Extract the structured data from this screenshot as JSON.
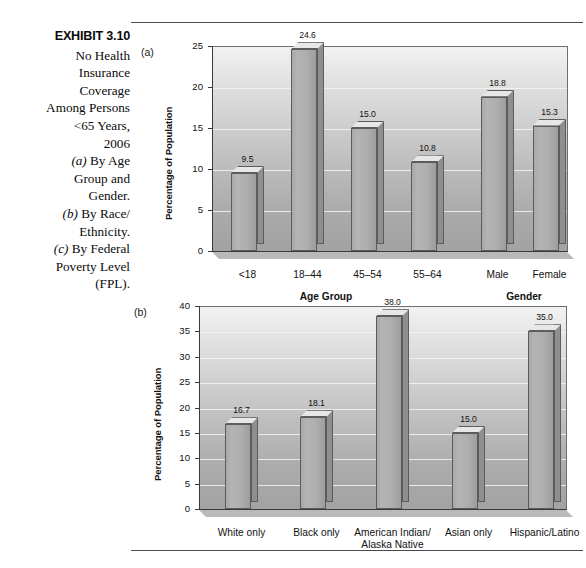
{
  "caption": {
    "exhibit_label": "EXHIBIT 3.10",
    "lines": [
      "No Health",
      "Insurance",
      "Coverage",
      "Among Persons",
      "<65 Years,",
      "2006"
    ],
    "notes": [
      {
        "tag": "(a)",
        "text": " By Age"
      },
      {
        "tag": "",
        "text": "Group and"
      },
      {
        "tag": "",
        "text": "Gender."
      },
      {
        "tag": "(b)",
        "text": " By Race/"
      },
      {
        "tag": "",
        "text": "Ethnicity."
      },
      {
        "tag": "(c)",
        "text": " By Federal"
      },
      {
        "tag": "",
        "text": "Poverty Level"
      },
      {
        "tag": "",
        "text": "(FPL)."
      }
    ]
  },
  "panel_a": {
    "tag": "(a)",
    "ylabel": "Percentage of Population",
    "yticks": [
      "25",
      "20",
      "15",
      "10",
      "5",
      "0"
    ],
    "group_labels": [
      "Age Group",
      "Gender"
    ]
  },
  "panel_b": {
    "tag": "(b)",
    "ylabel": "Percentage of Population",
    "yticks": [
      "40",
      "35",
      "30",
      "25",
      "20",
      "15",
      "10",
      "5",
      "0"
    ]
  },
  "chart_data": [
    {
      "type": "bar",
      "id": "a",
      "title": "No Health Insurance Coverage Among Persons <65 Years, 2006 — By Age Group and Gender",
      "xlabel": "Age Group / Gender",
      "ylabel": "Percentage of Population",
      "ylim": [
        0,
        25
      ],
      "ytick_step": 5,
      "grid": true,
      "legend": "none",
      "categories": [
        "<18",
        "18–44",
        "45–54",
        "55–64",
        "Male",
        "Female"
      ],
      "values": [
        9.5,
        24.6,
        15.0,
        10.8,
        18.8,
        15.3
      ],
      "value_labels": [
        "9.5",
        "24.6",
        "15.0",
        "10.8",
        "18.8",
        "15.3"
      ],
      "groups": [
        {
          "name": "Age Group",
          "categories": [
            "<18",
            "18–44",
            "45–54",
            "55–64"
          ]
        },
        {
          "name": "Gender",
          "categories": [
            "Male",
            "Female"
          ]
        }
      ]
    },
    {
      "type": "bar",
      "id": "b",
      "title": "No Health Insurance Coverage Among Persons <65 Years, 2006 — By Race/Ethnicity",
      "xlabel": "Race/Ethnicity",
      "ylabel": "Percentage of Population",
      "ylim": [
        0,
        40
      ],
      "ytick_step": 5,
      "grid": true,
      "legend": "none",
      "categories": [
        "White only",
        "Black only",
        "American Indian/ Alaska Native",
        "Asian only",
        "Hispanic/Latino"
      ],
      "category_lines": [
        [
          "White only"
        ],
        [
          "Black only"
        ],
        [
          "American Indian/",
          "Alaska Native"
        ],
        [
          "Asian only"
        ],
        [
          "Hispanic/Latino"
        ]
      ],
      "values": [
        16.7,
        18.1,
        38.0,
        15.0,
        35.0
      ],
      "value_labels": [
        "16.7",
        "18.1",
        "38.0",
        "15.0",
        "35.0"
      ]
    }
  ]
}
